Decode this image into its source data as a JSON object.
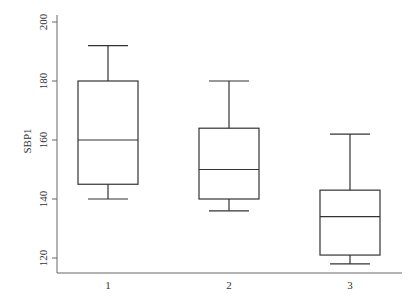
{
  "chart_data": {
    "type": "box",
    "title": "",
    "xlabel": "",
    "ylabel": "SBP1",
    "categories": [
      "1",
      "2",
      "3"
    ],
    "boxes": [
      {
        "name": "1",
        "whisker_low": 140,
        "q1": 145,
        "median": 160,
        "q3": 180,
        "whisker_high": 192
      },
      {
        "name": "2",
        "whisker_low": 136,
        "q1": 140,
        "median": 150,
        "q3": 164,
        "whisker_high": 180
      },
      {
        "name": "3",
        "whisker_low": 118,
        "q1": 121,
        "median": 134,
        "q3": 143,
        "whisker_high": 162
      }
    ],
    "yticks": [
      120,
      140,
      160,
      180,
      200
    ],
    "ylim": [
      115,
      202
    ],
    "grid": false,
    "legend": null
  },
  "colors": {
    "stroke": "#333333",
    "axis": "#666666"
  }
}
